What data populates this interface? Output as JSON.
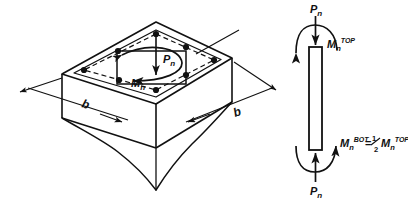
{
  "figure": {
    "type": "engineering-sketch",
    "title": "",
    "background_color": "#ffffff",
    "ink_color": "#111111",
    "panels": [
      {
        "id": "isometric-column-section",
        "name": "Isometric square column with reinforcement",
        "description": "Isometric view of a square reinforced concrete column block with broken-away bottom, showing 8 longitudinal bars, applied axial load and applied moment on the top face.",
        "labels": {
          "axial_load": "P",
          "axial_load_sub": "n",
          "moment": "M",
          "moment_sub": "n",
          "dim_left": "b",
          "dim_right": "b"
        },
        "rebar_count": 8
      },
      {
        "id": "column-elevation-free-body",
        "name": "Column elevation free-body diagram",
        "description": "Slender vertical column element with axial load at top and bottom and end moments.",
        "labels": {
          "top_load": "P",
          "top_load_sub": "n",
          "bottom_load": "P",
          "bottom_load_sub": "n",
          "top_moment_base": "M",
          "top_moment_sub": "n",
          "top_moment_sup": "TOP",
          "bottom_moment_base": "M",
          "bottom_moment_sub": "n",
          "bottom_moment_sup": "BOT",
          "equals": "=",
          "fraction_num": "1",
          "fraction_den": "2",
          "rhs_base": "M",
          "rhs_sub": "n",
          "rhs_sup": "TOP"
        }
      }
    ]
  }
}
